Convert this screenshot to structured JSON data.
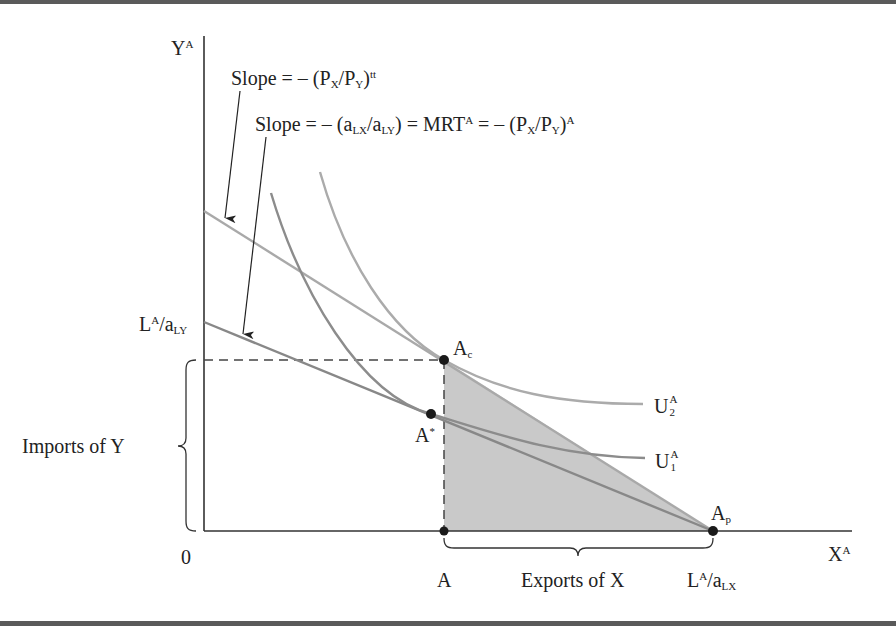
{
  "diagram": {
    "type": "trade-equilibrium",
    "axes": {
      "y_label": "Y",
      "y_label_sup": "A",
      "x_label": "X",
      "x_label_sup": "A",
      "origin_label": "0"
    },
    "annotations": {
      "slope_trade": {
        "prefix": "Slope = – (P",
        "sub1": "X",
        "mid": "/P",
        "sub2": "Y",
        "suffix": ")",
        "sup": "tt"
      },
      "slope_production": {
        "prefix": "Slope = – (a",
        "sub1": "LX",
        "mid": "/a",
        "sub2": "LY",
        "eq": ")  = MRT",
        "eq_sup": "A",
        "tail_prefix": " = – (P",
        "tail_sub1": "X",
        "tail_mid": "/P",
        "tail_sub2": "Y",
        "tail_suffix": ")",
        "tail_sup": "A"
      },
      "y_intercept": {
        "L": "L",
        "sup": "A",
        "a": "/a",
        "sub": "LY"
      },
      "x_intercept": {
        "L": "L",
        "sup": "A",
        "a": "/a",
        "sub": "LX"
      },
      "imports": "Imports of Y",
      "exports": "Exports of X"
    },
    "points": {
      "Ac": {
        "label": "A",
        "sub": "c"
      },
      "Astar": {
        "label": "A",
        "sup": "*"
      },
      "Ap": {
        "label": "A",
        "sub": "p"
      },
      "A": {
        "label": "A"
      }
    },
    "curves": {
      "U2": {
        "label": "U",
        "sup": "A",
        "sub": "2"
      },
      "U1": {
        "label": "U",
        "sup": "A",
        "sub": "1"
      }
    },
    "colors": {
      "axis": "#333333",
      "trade_line": "#a9a9a9",
      "production_line": "#888888",
      "u1": "#8c8c8c",
      "u2": "#ababab",
      "shading": "#c9c9c9",
      "points": "#1a1a1a"
    }
  }
}
